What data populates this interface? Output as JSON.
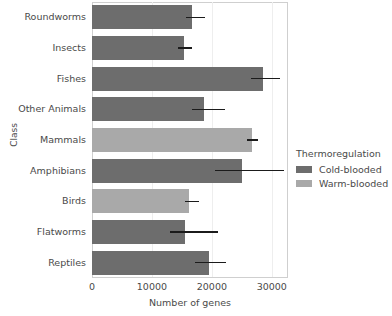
{
  "chart_data": {
    "type": "bar",
    "orientation": "horizontal",
    "title": "",
    "xlabel": "Number of genes",
    "ylabel": "Class",
    "xlim": [
      0,
      32700
    ],
    "xticks": [
      0,
      10000,
      20000,
      30000
    ],
    "xticklabels": [
      "0",
      "10000",
      "20000",
      "30000"
    ],
    "grid": "vertical-only",
    "categories": [
      "Roundworms",
      "Insects",
      "Fishes",
      "Other Animals",
      "Mammals",
      "Amphibians",
      "Birds",
      "Flatworms",
      "Reptiles"
    ],
    "values": [
      16700,
      15300,
      28500,
      18700,
      26700,
      25000,
      16200,
      15500,
      19500
    ],
    "errors_low": [
      15600,
      14300,
      26500,
      16700,
      25800,
      20500,
      15500,
      13000,
      17200
    ],
    "errors_high": [
      18800,
      16700,
      31300,
      22200,
      27700,
      32000,
      17800,
      21000,
      22300
    ],
    "groups": [
      "Cold-blooded",
      "Cold-blooded",
      "Cold-blooded",
      "Cold-blooded",
      "Warm-blooded",
      "Cold-blooded",
      "Warm-blooded",
      "Cold-blooded",
      "Cold-blooded"
    ],
    "legend": {
      "title": "Thermoregulation",
      "position": "right",
      "entries": [
        {
          "label": "Cold-blooded",
          "color": "#6d6d6d"
        },
        {
          "label": "Warm-blooded",
          "color": "#a9a9a9"
        }
      ]
    },
    "colors": {
      "cold_blooded": "#6d6d6d",
      "warm_blooded": "#a9a9a9",
      "error_bar": "#1b1b1b",
      "grid": "#eeeeee",
      "spine": "#cfcfcf",
      "text": "#4a4a4a",
      "background": "#ffffff"
    }
  }
}
